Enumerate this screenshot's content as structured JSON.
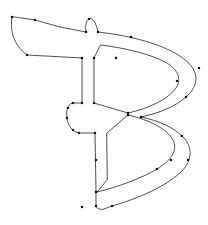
{
  "canvas": {
    "width": 208,
    "height": 225,
    "background_color": "#ffffff"
  },
  "glyph": {
    "character": "B",
    "description": "vector outline of letter B with anchor points",
    "stroke_color": "#222222",
    "stroke_width": 0.8,
    "fill": "none",
    "anchor_color": "#111111",
    "anchor_size": 2.2,
    "contours": [
      {
        "name": "outer-contour",
        "d": "M 12 17 C 10 31 13 44 27 55 L 82 58 L 82 103 L 73 103 C 67 104 66 112 67 118 C 68 126 72 131 79 133 L 95 133 L 96 192 L 96 206 C 97 209 100 210 104 209 L 112 206 C 140 198 166 186 181 172 C 193 160 193 146 182 136 C 174 128 160 121 141 117 C 160 113 176 106 186 97 C 200 85 199 70 184 59 C 170 48 144 39 113 34 L 98 32 C 96 22 92 17 89 19 C 86 20 85 26 86 32 L 60 27 L 35 20 Z"
      },
      {
        "name": "upper-counter",
        "d": "M 94 58 L 94 103 L 128 113 C 150 108 168 99 176 88 C 182 79 178 69 165 62 C 150 54 125 48 101 45 Z"
      },
      {
        "name": "lower-counter",
        "d": "M 107 133 L 128 115 C 150 120 167 129 173 140 C 178 150 172 160 157 169 C 142 178 118 187 97 192 L 107 180 Z"
      }
    ],
    "anchors": [
      {
        "x": 12,
        "y": 17,
        "name": "top-left-terminal"
      },
      {
        "x": 35,
        "y": 20,
        "name": "top-edge-left"
      },
      {
        "x": 27,
        "y": 55,
        "name": "left-terminal-bottom"
      },
      {
        "x": 86,
        "y": 32,
        "name": "top-bump-left-base"
      },
      {
        "x": 89,
        "y": 19,
        "name": "top-bump-apex"
      },
      {
        "x": 98,
        "y": 32,
        "name": "top-bump-right-base"
      },
      {
        "x": 131,
        "y": 37,
        "name": "upper-outer-top"
      },
      {
        "x": 199,
        "y": 68,
        "name": "upper-outer-right-extreme"
      },
      {
        "x": 186,
        "y": 97,
        "name": "upper-outer-lower-right"
      },
      {
        "x": 128,
        "y": 113,
        "name": "upper-waist-right"
      },
      {
        "x": 82,
        "y": 58,
        "name": "stem-top-left"
      },
      {
        "x": 94,
        "y": 58,
        "name": "stem-top-right"
      },
      {
        "x": 116,
        "y": 58,
        "name": "upper-counter-top"
      },
      {
        "x": 177,
        "y": 81,
        "name": "upper-counter-right-extreme"
      },
      {
        "x": 82,
        "y": 103,
        "name": "stem-waist-upper-left"
      },
      {
        "x": 94,
        "y": 103,
        "name": "upper-counter-bottom-left"
      },
      {
        "x": 73,
        "y": 103,
        "name": "waist-lobe-top"
      },
      {
        "x": 68,
        "y": 108,
        "name": "waist-lobe-upper-left"
      },
      {
        "x": 67,
        "y": 118,
        "name": "waist-lobe-left-extreme"
      },
      {
        "x": 73,
        "y": 130,
        "name": "waist-lobe-bottom"
      },
      {
        "x": 79,
        "y": 133,
        "name": "stem-waist-lower-left"
      },
      {
        "x": 95,
        "y": 133,
        "name": "lower-counter-top-left"
      },
      {
        "x": 128,
        "y": 115,
        "name": "lower-counter-top-right"
      },
      {
        "x": 171,
        "y": 160,
        "name": "lower-counter-right-extreme"
      },
      {
        "x": 188,
        "y": 160,
        "name": "lower-outer-right-extreme"
      },
      {
        "x": 182,
        "y": 136,
        "name": "lower-outer-upper-right"
      },
      {
        "x": 141,
        "y": 117,
        "name": "lower-outer-top"
      },
      {
        "x": 96,
        "y": 192,
        "name": "lower-counter-bottom-left"
      },
      {
        "x": 157,
        "y": 169,
        "name": "lower-counter-bottom-right"
      },
      {
        "x": 112,
        "y": 206,
        "name": "lower-outer-bottom"
      },
      {
        "x": 96,
        "y": 206,
        "name": "stem-foot-right"
      },
      {
        "x": 82,
        "y": 207,
        "name": "stem-foot-left"
      },
      {
        "x": 96,
        "y": 160,
        "name": "stem-lower-mid"
      }
    ]
  }
}
